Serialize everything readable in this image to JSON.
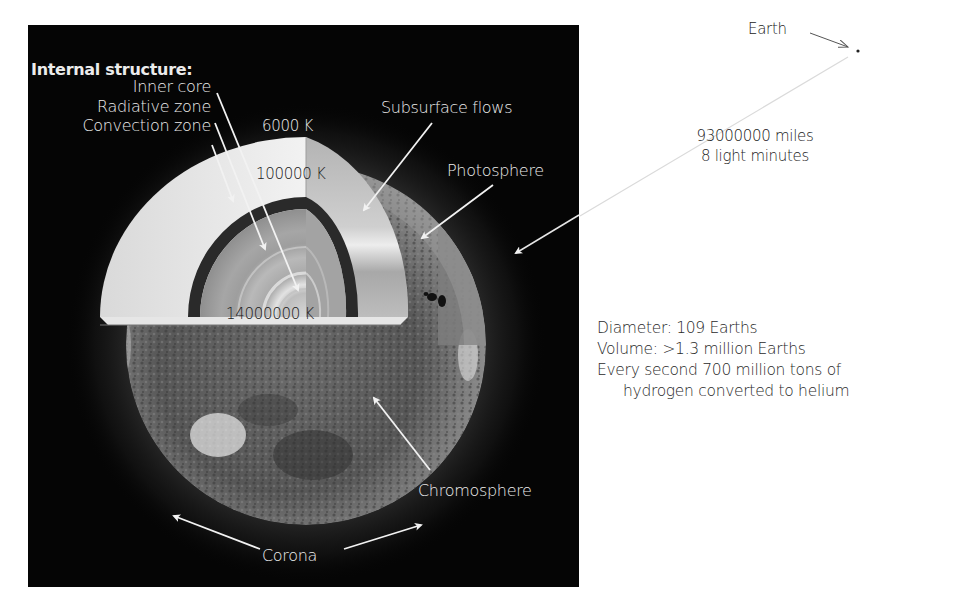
{
  "diagram": {
    "internal_structure": {
      "heading": "Internal structure:",
      "layers": [
        {
          "label": "Inner core"
        },
        {
          "label": "Radiative zone"
        },
        {
          "label": "Convection zone"
        }
      ]
    },
    "temperatures": {
      "surface": "6000 K",
      "convection_base": "100000 K",
      "core": "14000000 K"
    },
    "surface_labels": {
      "subsurface_flows": "Subsurface flows",
      "photosphere": "Photosphere",
      "chromosphere": "Chromosphere",
      "corona": "Corona"
    },
    "earth": {
      "label": "Earth",
      "distance_miles": "93000000 miles",
      "distance_light": "8 light minutes"
    },
    "facts": [
      "Diameter: 109 Earths",
      "Volume: >1.3 million Earths",
      "Every second 700 million  tons of",
      "hydrogen converted to helium"
    ],
    "colors": {
      "background": "#ffffff",
      "panel": "#050505",
      "label_light": "#ececec",
      "label_dark": "#1a1a1a"
    }
  }
}
